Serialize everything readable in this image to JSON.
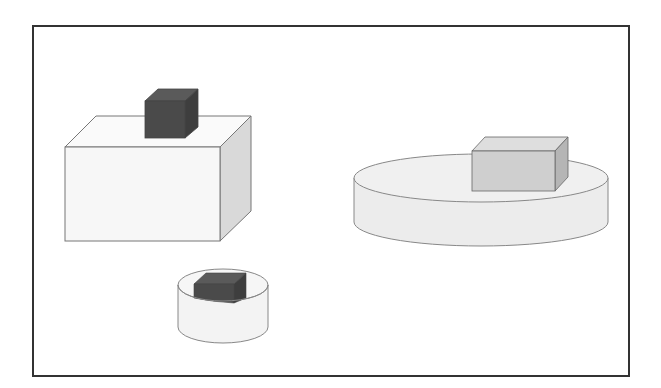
{
  "diagram": {
    "type": "3d-shapes-scene",
    "frame": {
      "border_color": "#333333"
    },
    "objects": [
      {
        "id": "large-box",
        "shape": "rectangular-prism",
        "front_color": "#f7f7f7",
        "top_color": "#fafafa",
        "side_color": "#d9d9d9",
        "stroke": "#777777",
        "carries": "dark-cube"
      },
      {
        "id": "dark-cube",
        "shape": "cube",
        "front_color": "#4a4a4a",
        "top_color": "#5a5a5a",
        "side_color": "#3e3e3e",
        "rests_on": "large-box"
      },
      {
        "id": "wide-cylinder",
        "shape": "cylinder",
        "body_color": "#ececec",
        "top_color": "#f0f0f0",
        "stroke": "#888888",
        "carries": "gray-box"
      },
      {
        "id": "gray-box",
        "shape": "rectangular-prism",
        "front_color": "#cfcfcf",
        "top_color": "#dedede",
        "side_color": "#b5b5b5",
        "rests_on": "wide-cylinder"
      },
      {
        "id": "small-cylinder",
        "shape": "cylinder",
        "body_color": "#f3f3f3",
        "stroke": "#888888",
        "contains": "small-dark-box"
      },
      {
        "id": "small-dark-box",
        "shape": "rectangular-prism",
        "front_color": "#4a4a4a",
        "top_color": "#5a5a5a",
        "inside": "small-cylinder"
      }
    ]
  }
}
